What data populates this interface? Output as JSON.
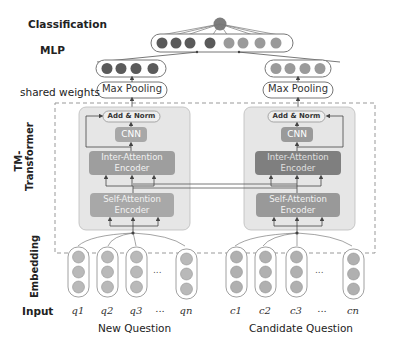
{
  "labels": {
    "classification": "Classification",
    "mlp": "MLP",
    "shared_weights": "shared weights",
    "tm_transformer_line1": "TM-",
    "tm_transformer_line2": "Transformer",
    "embedding": "Embedding",
    "input": "Input"
  },
  "left_tower": {
    "max_pooling": "Max Pooling",
    "add_norm": "Add & Norm",
    "cnn": "CNN",
    "inter_attention_line1": "Inter-Attention",
    "inter_attention_line2": "Encoder",
    "self_attention_line1": "Self-Attention",
    "self_attention_line2": "Encoder",
    "inputs": [
      "q1",
      "q2",
      "q3",
      "...",
      "qn"
    ],
    "input_subs": [
      [
        "q",
        "1"
      ],
      [
        "q",
        "2"
      ],
      [
        "q",
        "3"
      ],
      [
        "…",
        ""
      ],
      [
        "q",
        "n"
      ]
    ],
    "caption": "New Question"
  },
  "right_tower": {
    "max_pooling": "Max Pooling",
    "add_norm": "Add & Norm",
    "cnn": "CNN",
    "inter_attention_line1": "Inter-Attention",
    "inter_attention_line2": "Encoder",
    "self_attention_line1": "Self-Attention",
    "self_attention_line2": "Encoder",
    "inputs": [
      "c1",
      "c2",
      "c3",
      "...",
      "cn"
    ],
    "caption": "Candidate Question"
  },
  "ellipsis": "...",
  "colors": {
    "dark_node": "#5a5a5a",
    "light_node": "#9a9a9a",
    "embed_node": "#b9b9b9",
    "tower_bg": "#e6e6e6",
    "encoder_left": "#a8a8a8",
    "encoder_right": "#8a8a8a",
    "add_norm_bg": "#efefef",
    "dashed_border": "#999999"
  }
}
